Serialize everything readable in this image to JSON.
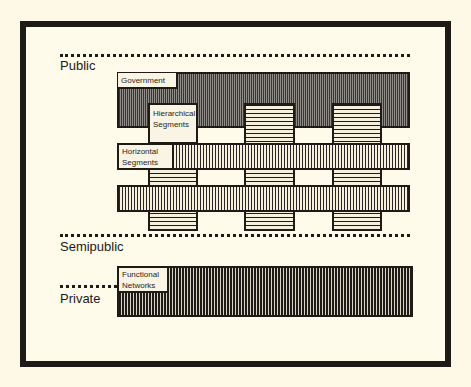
{
  "diagram": {
    "tiers": [
      {
        "id": "public",
        "label": "Public"
      },
      {
        "id": "semipublic",
        "label": "Semipublic"
      },
      {
        "id": "private",
        "label": "Private"
      }
    ],
    "blocks": {
      "government": {
        "label": "Government"
      },
      "hierarchical_segments": {
        "label_line1": "Hierarchical",
        "label_line2": "Segments"
      },
      "horizontal_segments": {
        "label_line1": "Horizontal",
        "label_line2": "Segments"
      },
      "functional_networks": {
        "label_line1": "Functional",
        "label_line2": "Networks"
      }
    },
    "colors": {
      "background": "#fdf9e6",
      "ink": "#1e1a16",
      "dark_fill": "#3a3532",
      "light_fill": "#f6f1de"
    }
  }
}
